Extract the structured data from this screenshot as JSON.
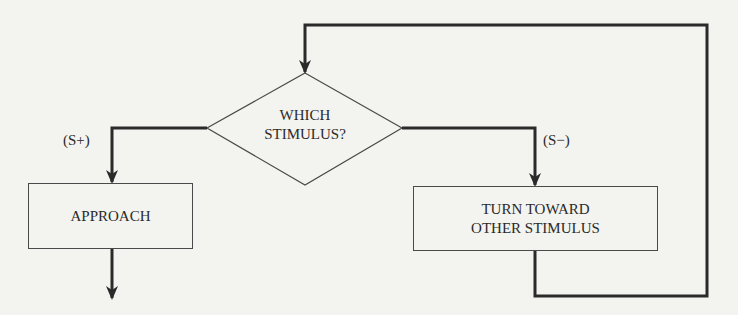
{
  "diagram": {
    "type": "flowchart",
    "decision": {
      "lines": [
        "WHICH",
        "STIMULUS?"
      ]
    },
    "branches": {
      "left": {
        "label": "(S+)"
      },
      "right": {
        "label": "(S−)"
      }
    },
    "process_boxes": {
      "approach": {
        "lines": [
          "APPROACH"
        ]
      },
      "turn": {
        "lines": [
          "TURN TOWARD",
          "OTHER STIMULUS"
        ]
      }
    },
    "colors": {
      "background": "#f3f3ef",
      "stroke": "#2a2a2a",
      "text": "#2a2a2a"
    }
  }
}
